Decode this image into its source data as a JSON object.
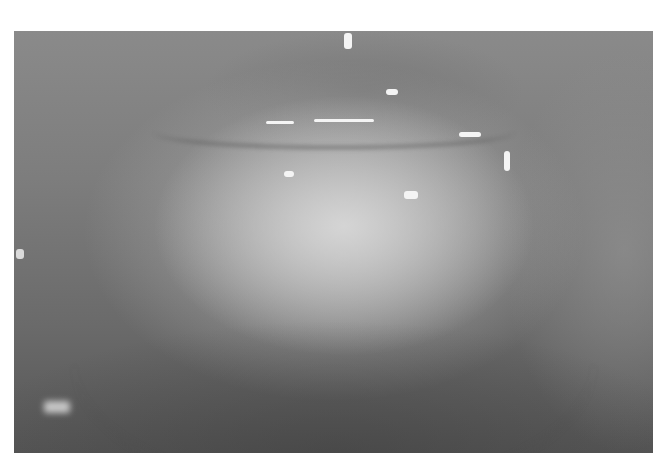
{
  "image": {
    "description": "Grayscale clinical photograph of lower lip and chin region with a whitish lesion",
    "border_color": "#ffffff",
    "tone": "grayscale"
  }
}
